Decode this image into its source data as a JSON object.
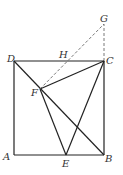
{
  "diagram": {
    "labels": {
      "A": "A",
      "B": "B",
      "C": "C",
      "D": "D",
      "E": "E",
      "F": "F",
      "G": "G",
      "H": "H"
    },
    "points": {
      "A": [
        14,
        155
      ],
      "B": [
        104,
        155
      ],
      "C": [
        104,
        61
      ],
      "D": [
        14,
        61
      ],
      "E": [
        66,
        155
      ],
      "F": [
        40,
        89
      ],
      "G": [
        104,
        24
      ],
      "H": [
        66,
        61
      ]
    },
    "solid_segments": [
      [
        "A",
        "B"
      ],
      [
        "B",
        "C"
      ],
      [
        "C",
        "D"
      ],
      [
        "D",
        "A"
      ],
      [
        "D",
        "B"
      ],
      [
        "F",
        "C"
      ],
      [
        "F",
        "E"
      ],
      [
        "E",
        "C"
      ]
    ],
    "dashed_segments": [
      [
        "F",
        "G"
      ],
      [
        "C",
        "G"
      ]
    ],
    "colors": {
      "line": "#222222",
      "dashed": "#555555",
      "label": "#333333"
    }
  }
}
